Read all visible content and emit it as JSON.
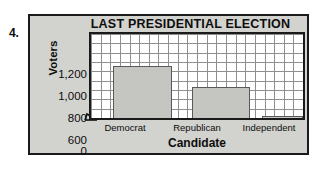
{
  "question_number": "4.",
  "chart_data": {
    "type": "bar",
    "title": "LAST PRESIDENTIAL ELECTION",
    "xlabel": "Candidate",
    "ylabel": "Voters",
    "categories": [
      "Democrat",
      "Republican",
      "Independent"
    ],
    "values": [
      1000,
      800,
      520
    ],
    "ytick_labels": [
      "1,200",
      "1,000",
      "800",
      "600",
      "0"
    ],
    "ytick_values": [
      1200,
      1000,
      800,
      600,
      0
    ],
    "ylim": [
      500,
      1300
    ],
    "axis_break": true,
    "axis_break_icon": "zigzag-break-icon",
    "grid": true,
    "grid_columns": 22,
    "grid_rows": 9,
    "legend": "none",
    "colors": {
      "bar_fill": "#c5c5c2",
      "bar_stroke": "#595959",
      "plot_background": "#ffffff",
      "grid_line": "#8e8e8e",
      "panel_background": "#d2d2ce",
      "border": "#1a1a1a",
      "text": "#0d0d0d"
    }
  }
}
